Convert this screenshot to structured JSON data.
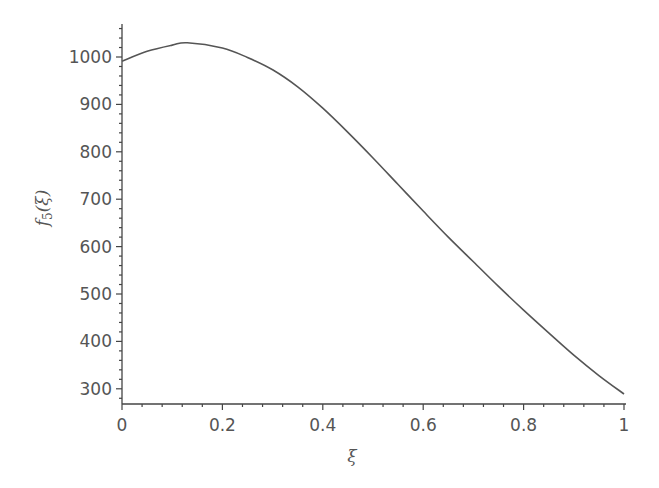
{
  "chart_data": {
    "type": "line",
    "title": "",
    "xlabel": "ξ",
    "ylabel": "f5(ξ)",
    "ylabel_parts": {
      "func": "f",
      "sub": "5",
      "arg": "(ξ)"
    },
    "xlim": [
      0,
      1
    ],
    "ylim": [
      268,
      1068
    ],
    "grid": false,
    "legend": null,
    "x_ticks": [
      0,
      0.2,
      0.4,
      0.6,
      0.8,
      1
    ],
    "x_tick_labels": [
      "0",
      "0.2",
      "0.4",
      "0.6",
      "0.8",
      "1"
    ],
    "y_ticks": [
      300,
      400,
      500,
      600,
      700,
      800,
      900,
      1000
    ],
    "y_tick_labels": [
      "300",
      "400",
      "500",
      "600",
      "700",
      "800",
      "900",
      "1000"
    ],
    "series": [
      {
        "name": "f5(ξ)",
        "color": "#555555",
        "x": [
          0,
          0.05,
          0.1,
          0.13,
          0.2,
          0.25,
          0.3,
          0.35,
          0.4,
          0.45,
          0.5,
          0.55,
          0.6,
          0.65,
          0.7,
          0.75,
          0.8,
          0.85,
          0.9,
          0.95,
          1.0
        ],
        "values": [
          991,
          1012,
          1025,
          1030,
          1019,
          999,
          973,
          937,
          892,
          841,
          787,
          731,
          675,
          620,
          568,
          516,
          466,
          418,
          371,
          328,
          289
        ]
      }
    ]
  }
}
